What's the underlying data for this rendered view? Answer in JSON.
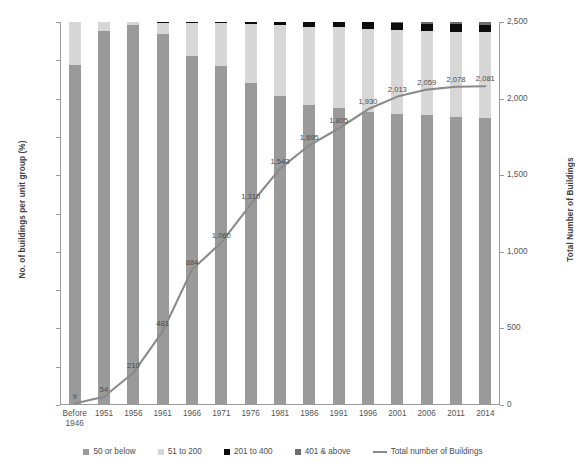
{
  "chart_data": {
    "type": "bar",
    "title": "",
    "xlabel": "",
    "ylabel": "No. of buildings per unit group (%)",
    "y2label": "Total Number of Buildings",
    "ylim": [
      0,
      100
    ],
    "y2lim": [
      0,
      2500
    ],
    "grid": false,
    "legend_position": "bottom",
    "categories": [
      "Before\n1946",
      "1951",
      "1956",
      "1961",
      "1966",
      "1971",
      "1976",
      "1981",
      "1986",
      "1991",
      "1996",
      "2001",
      "2006",
      "2011",
      "2014"
    ],
    "ytick_labels": [
      "0%",
      "10%",
      "20%",
      "30%",
      "40%",
      "50%",
      "60%",
      "70%",
      "80%",
      "90%",
      "100%"
    ],
    "y2tick_labels": [
      "0",
      "500",
      "1,000",
      "1,500",
      "2,000",
      "2,500"
    ],
    "series": [
      {
        "name": "50 or below",
        "color": "#9a9a9a",
        "type": "bar",
        "values": [
          88.7,
          97.6,
          99.2,
          96.8,
          91.1,
          88.5,
          84.2,
          80.8,
          78.4,
          77.6,
          76.6,
          76.0,
          75.6,
          75.2,
          75.0
        ]
      },
      {
        "name": "51 to 200",
        "color": "#d7d7d7",
        "type": "bar",
        "values": [
          11.3,
          2.4,
          0.8,
          3.0,
          8.7,
          11.2,
          15.2,
          18.4,
          20.4,
          21.0,
          21.7,
          21.9,
          22.0,
          22.2,
          22.3
        ]
      },
      {
        "name": "201 to 400",
        "color": "#0d0d0d",
        "type": "bar",
        "values": [
          0.0,
          0.0,
          0.0,
          0.2,
          0.2,
          0.3,
          0.6,
          0.8,
          1.2,
          1.4,
          1.7,
          1.8,
          1.9,
          2.0,
          2.0
        ]
      },
      {
        "name": "401 & above",
        "color": "#6e6e6e",
        "type": "bar",
        "values": [
          0.0,
          0.0,
          0.0,
          0.0,
          0.0,
          0.0,
          0.0,
          0.0,
          0.0,
          0.0,
          0.0,
          0.3,
          0.5,
          0.6,
          0.7
        ]
      },
      {
        "name": "Total number of Buildings",
        "color": "#8a8a8a",
        "type": "line",
        "axis": "right",
        "values": [
          9,
          54,
          210,
          481,
          884,
          1060,
          1310,
          1543,
          1695,
          1805,
          1930,
          2013,
          2059,
          2078,
          2081
        ],
        "labels": [
          "9",
          "54",
          "210",
          "481",
          "884",
          "1,060",
          "1,310",
          "1,543",
          "1,695",
          "1,805",
          "1,930",
          "2,013",
          "2,059",
          "2,078",
          "2,081"
        ]
      }
    ]
  },
  "legend": {
    "items": [
      {
        "label": "50 or below",
        "color": "#9a9a9a",
        "shape": "square"
      },
      {
        "label": "51 to 200",
        "color": "#d7d7d7",
        "shape": "square"
      },
      {
        "label": "201 to 400",
        "color": "#0d0d0d",
        "shape": "square"
      },
      {
        "label": "401 & above",
        "color": "#6e6e6e",
        "shape": "square"
      },
      {
        "label": "Total number of Buildings",
        "color": "#8a8a8a",
        "shape": "line"
      }
    ]
  }
}
